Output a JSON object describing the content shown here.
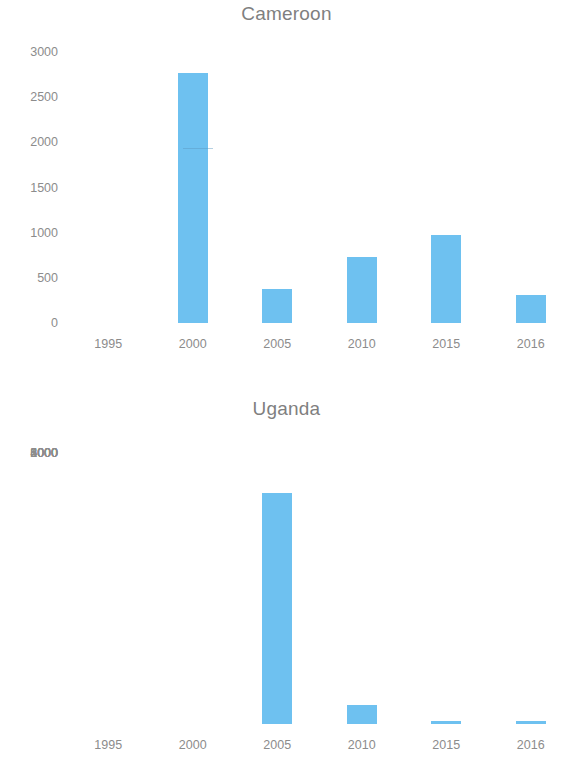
{
  "figure": {
    "background_color": "#ffffff",
    "bar_color": "#6EC1F0",
    "axis_text_color": "#8c8c8c",
    "title_color": "#7f7f7f"
  },
  "panels": [
    {
      "id": "cameroon",
      "title": "Cameroon",
      "y_ticks": [
        "3000",
        "2500",
        "2000",
        "1500",
        "1000",
        "500",
        "0"
      ],
      "x_ticks": [
        "1995",
        "2000",
        "2005",
        "2010",
        "2015",
        "2016"
      ]
    },
    {
      "id": "uganda",
      "title": "Uganda",
      "y_ticks": [
        "6000",
        "5000",
        "4000",
        "3000",
        "2000",
        "1000",
        "0"
      ],
      "x_ticks": [
        "1995",
        "2000",
        "2005",
        "2010",
        "2015",
        "2016"
      ]
    }
  ],
  "chart_data": [
    {
      "type": "bar",
      "title": "Cameroon",
      "xlabel": "",
      "ylabel": "",
      "categories": [
        "1995",
        "2000",
        "2005",
        "2010",
        "2015",
        "2016"
      ],
      "values": [
        0,
        2770,
        380,
        730,
        970,
        310
      ],
      "ylim": [
        0,
        3000
      ],
      "ytick_values": [
        0,
        500,
        1000,
        1500,
        2000,
        2500,
        3000
      ],
      "grid": false,
      "legend": false,
      "series": [
        {
          "name": "Cameroon",
          "values": [
            0,
            2770,
            380,
            730,
            970,
            310
          ]
        }
      ]
    },
    {
      "type": "bar",
      "title": "Uganda",
      "xlabel": "",
      "ylabel": "",
      "categories": [
        "1995",
        "2000",
        "2005",
        "2010",
        "2015",
        "2016"
      ],
      "values": [
        0,
        0,
        5120,
        420,
        55,
        60
      ],
      "ylim": [
        0,
        6000
      ],
      "ytick_values": [
        0,
        1000,
        2000,
        3000,
        4000,
        5000,
        6000
      ],
      "grid": false,
      "legend": false,
      "series": [
        {
          "name": "Uganda",
          "values": [
            0,
            0,
            5120,
            420,
            55,
            60
          ]
        }
      ]
    }
  ]
}
